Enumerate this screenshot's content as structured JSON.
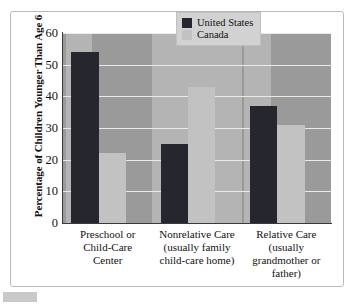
{
  "chart_data": {
    "type": "bar",
    "title": "",
    "xlabel": "",
    "ylabel": "Percentage of Children Younger Than Age 6",
    "ylim": [
      0,
      60
    ],
    "ytick_step": 10,
    "yticks": [
      "0",
      "10",
      "20",
      "30",
      "40",
      "50",
      "60"
    ],
    "grid": true,
    "legend_position": "top-right",
    "categories": [
      "Preschool or Child-Care Center",
      "Nonrelative Care (usually family child-care home)",
      "Relative Care (usually grandmother or father)"
    ],
    "category_lines": [
      [
        "Preschool or",
        "Child-Care",
        "Center"
      ],
      [
        "Nonrelative Care",
        "(usually family",
        "child-care home)"
      ],
      [
        "Relative Care",
        "(usually",
        "grandmother or",
        "father)"
      ]
    ],
    "series": [
      {
        "name": "United States",
        "color": "#26262e",
        "values": [
          54,
          25,
          37
        ]
      },
      {
        "name": "Canada",
        "color": "#c2c2c2",
        "values": [
          22,
          43,
          31
        ]
      }
    ]
  },
  "colors": {
    "plot_background": "#9a9a9a",
    "plot_band": "#b4b4b4",
    "gridline": "#eceae7",
    "axis": "#3a3a3a",
    "frame": "#b9b9b9",
    "legend_background": "#d2d2d2",
    "page_background": "#ffffff",
    "caption_stub": "#c9c9c9"
  }
}
